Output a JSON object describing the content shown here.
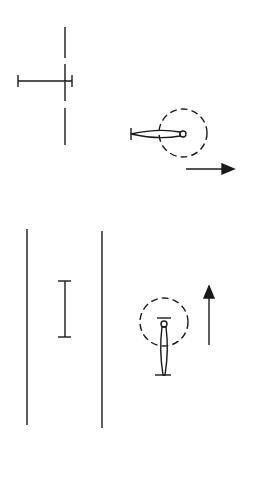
{
  "diagram": {
    "title": "",
    "stroke_color": "#1a1a1a",
    "background": "#ffffff",
    "figures": [
      {
        "id": "top-left",
        "description": "dashed vertical axis with horizontal bar marker"
      },
      {
        "id": "top-right",
        "description": "horizontal needle pivoting in dashed circle",
        "arrow_direction": "right"
      },
      {
        "id": "bottom-left",
        "description": "two parallel vertical lines with vertical bar marker"
      },
      {
        "id": "bottom-right",
        "description": "vertical needle pivoting in dashed circle",
        "arrow_direction": "up"
      }
    ]
  }
}
